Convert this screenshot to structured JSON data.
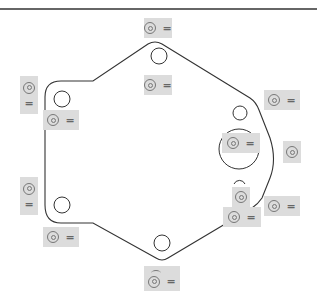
{
  "diagram": {
    "type": "technical-drawing",
    "symbol_icon": "concentric-circle-icon",
    "colors": {
      "outline": "#333333",
      "label_bg": "#dcdcdc",
      "symbol": "#777777"
    },
    "labels": [
      {
        "id": "top-hole-upper",
        "symbol": "◎",
        "text": "="
      },
      {
        "id": "top-hole-lower",
        "symbol": "◎",
        "text": "="
      },
      {
        "id": "left-upper-vertical",
        "symbol": "◎",
        "text": "="
      },
      {
        "id": "left-upper-hole",
        "symbol": "◎",
        "text": "="
      },
      {
        "id": "right-upper",
        "symbol": "◎",
        "text": "="
      },
      {
        "id": "center-large-hole",
        "symbol": "◎",
        "text": "="
      },
      {
        "id": "right-middle",
        "symbol": "◎",
        "text": ""
      },
      {
        "id": "small-arc-hole",
        "symbol": "◎",
        "text": ""
      },
      {
        "id": "right-lower",
        "symbol": "◎",
        "text": "="
      },
      {
        "id": "right-lower-inner",
        "symbol": "◎",
        "text": "="
      },
      {
        "id": "left-lower-vertical",
        "symbol": "◎",
        "text": "="
      },
      {
        "id": "left-lower-hole",
        "symbol": "◎",
        "text": "="
      },
      {
        "id": "bottom-hole",
        "symbol": "◎",
        "text": "="
      }
    ]
  }
}
